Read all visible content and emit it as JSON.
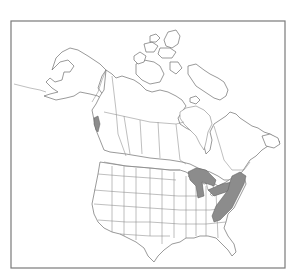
{
  "map": {
    "type": "species-range-map",
    "region": "North America (Canada, United States, Alaska)",
    "projection_frame": {
      "x": 11,
      "y": 21,
      "width": 274,
      "height": 247
    },
    "colors": {
      "background": "#ffffff",
      "frame": "#7a7a7a",
      "outline": "#6e6e6e",
      "range_fill": "#8c8c8c"
    },
    "shaded_ranges": [
      {
        "name": "pacific-northwest-coast",
        "description": "Coastal British Columbia / Vancouver Island area"
      },
      {
        "name": "great-lakes",
        "description": "Around Lakes Superior, Michigan, Huron, Erie, Ontario"
      },
      {
        "name": "appalachian-northeast",
        "description": "Appalachian region from Tennessee/North Carolina through Pennsylvania, New York and New England"
      }
    ],
    "labels": []
  }
}
